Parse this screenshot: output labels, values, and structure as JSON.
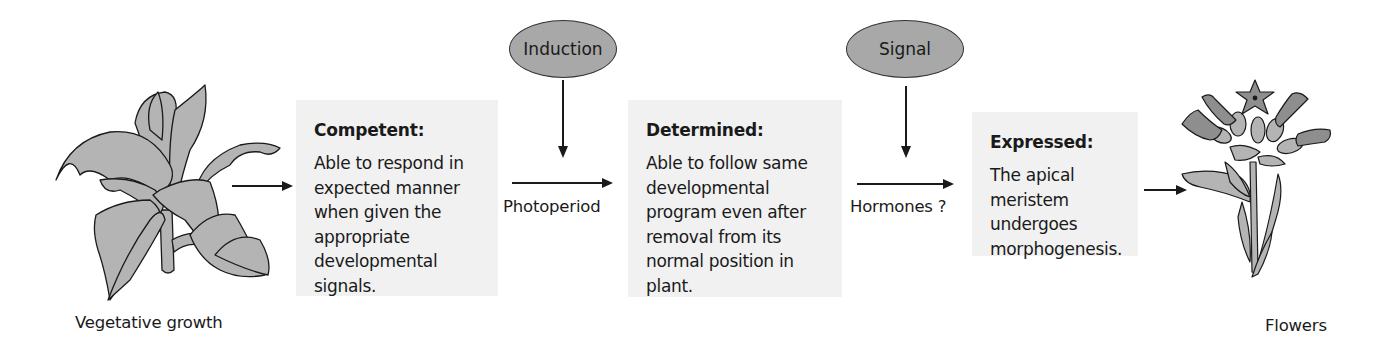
{
  "diagram": {
    "type": "flowchart",
    "direction": "left-to-right",
    "colors": {
      "box_fill": "#f1f1f1",
      "oval_fill": "#a8a8a8",
      "plant_fill": "#b4b4b4",
      "flower_fill": "#8e8e8e",
      "stroke": "#1a1a1a"
    },
    "start": {
      "label": "Vegetative growth",
      "icon": "vegetative-plant-icon"
    },
    "end": {
      "label": "Flowers",
      "icon": "flowering-plant-icon"
    },
    "stages": [
      {
        "title": "Competent:",
        "text": "Able to respond in\nexpected manner\nwhen given the\nappropriate\ndevelopmental\nsignals."
      },
      {
        "title": "Determined:",
        "text": "Able to follow same\ndevelopmental\nprogram even after\nremoval from its\nnormal position in\nplant."
      },
      {
        "title": "Expressed:",
        "text": "The apical\nmeristem\nundergoes\nmorphogenesis."
      }
    ],
    "inputs": [
      {
        "oval_label": "Induction",
        "arrow_label": "Photoperiod"
      },
      {
        "oval_label": "Signal",
        "arrow_label": "Hormones ?"
      }
    ],
    "edges": [
      {
        "from": "Vegetative growth",
        "to": "Competent:"
      },
      {
        "from": "Competent:",
        "to": "Determined:",
        "label": "Photoperiod",
        "input": "Induction"
      },
      {
        "from": "Determined:",
        "to": "Expressed:",
        "label": "Hormones ?",
        "input": "Signal"
      },
      {
        "from": "Expressed:",
        "to": "Flowers"
      }
    ]
  }
}
